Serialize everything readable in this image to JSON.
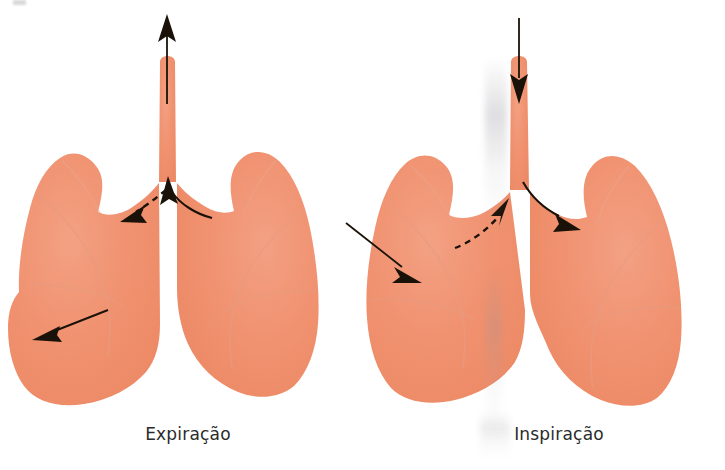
{
  "figure": {
    "title_visible": false,
    "background_color": "#ffffff",
    "width": 725,
    "height": 470,
    "kind": "anatomical-diagram"
  },
  "palette": {
    "lung_fill": "#F0906E",
    "lung_fill_light": "#F4A387",
    "lung_shade": "#E7A58E",
    "lung_texture": "#EDA98E",
    "arrow_color": "#1a1208",
    "label_color": "#2b2b2b",
    "artifact_gray": "#b0b0b6"
  },
  "panels": [
    {
      "id": "expiration",
      "label": "Expiração",
      "organ_name": "lungs",
      "trachea_name": "trachea",
      "arrows": [
        {
          "name": "trachea-outflow-arrow",
          "type": "straight",
          "direction": "up",
          "meaning": "air-leaving-trachea",
          "style": "solid"
        },
        {
          "name": "bronchus-inflow-arrow-right",
          "type": "curved",
          "direction": "up-left",
          "meaning": "air-moving-from-right-lung-to-trachea",
          "style": "solid"
        },
        {
          "name": "bronchus-arrow-left",
          "type": "straight",
          "direction": "down-left",
          "meaning": "air-moving-out-of-left-lung",
          "style": "dashed"
        },
        {
          "name": "lung-recoil-arrow",
          "type": "straight",
          "direction": "down-left",
          "meaning": "lung-volume-decreasing",
          "style": "solid"
        }
      ]
    },
    {
      "id": "inspiration",
      "label": "Inspiração",
      "organ_name": "lungs",
      "trachea_name": "trachea",
      "arrows": [
        {
          "name": "trachea-inflow-arrow",
          "type": "straight",
          "direction": "down",
          "meaning": "air-entering-trachea",
          "style": "solid"
        },
        {
          "name": "bronchus-outflow-arrow-right",
          "type": "curved",
          "direction": "down-right",
          "meaning": "air-moving-into-right-lung",
          "style": "solid"
        },
        {
          "name": "bronchus-arrow-left",
          "type": "straight",
          "direction": "up-right",
          "meaning": "air-moving-into-left-lung",
          "style": "dashed"
        }
      ]
    }
  ],
  "between_panels": {
    "arrow": {
      "name": "expansion-arrow",
      "direction": "down-right",
      "style": "solid",
      "meaning": "chest-wall-expansion"
    }
  },
  "artifacts": {
    "top_left_mark": "scan-edge-mark",
    "vertical_streak": "scan-shadow-streak"
  }
}
